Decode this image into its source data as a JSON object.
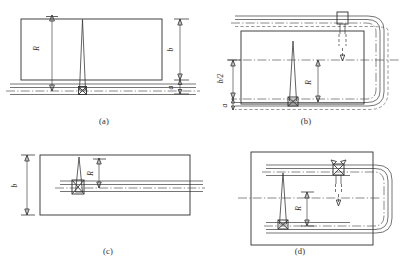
{
  "figure": {
    "title": "",
    "panels": [
      {
        "id": "a",
        "caption": "(a)",
        "labels": {
          "radius": "R",
          "height": "b",
          "offset": "a"
        }
      },
      {
        "id": "b",
        "caption": "(b)",
        "labels": {
          "radius": "R",
          "half_height": "b/2",
          "offset": "a"
        }
      },
      {
        "id": "c",
        "caption": "(c)",
        "labels": {
          "radius": "R",
          "height": "b"
        }
      },
      {
        "id": "d",
        "caption": "(d)",
        "labels": {
          "radius": "R"
        }
      }
    ]
  },
  "colors": {
    "line": "#3a3a3a",
    "box": "#2e2e2e",
    "dashed": "#6a6a6a",
    "centerline": "#4a4a4a",
    "background": "#ffffff",
    "text": "#262626"
  }
}
